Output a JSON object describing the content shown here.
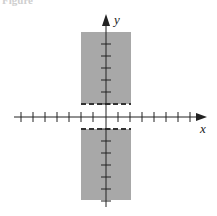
{
  "caption": "Figure",
  "figure": {
    "x_axis_label": "x",
    "y_axis_label": "y",
    "shade_color": "#a8a8a8",
    "axis_color": "#222222"
  }
}
